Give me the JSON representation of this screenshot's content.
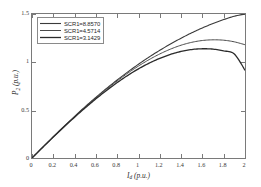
{
  "chart_data": {
    "type": "line",
    "title": "",
    "xlabel": "I_d (p.u.)",
    "ylabel": "P_2 (p.u.)",
    "xlabel_main": "I",
    "xlabel_sub": "d",
    "xlabel_unit": " (p.u.)",
    "ylabel_main": "P",
    "ylabel_sub": "2",
    "ylabel_unit": " (p.u.)",
    "xlim": [
      0,
      2
    ],
    "ylim": [
      0,
      1.5
    ],
    "xticks": [
      "0",
      "0.2",
      "0.4",
      "0.6",
      "0.8",
      "1",
      "1.2",
      "1.4",
      "1.6",
      "1.8",
      "2"
    ],
    "xtick_values": [
      0,
      0.2,
      0.4,
      0.6,
      0.8,
      1,
      1.2,
      1.4,
      1.6,
      1.8,
      2
    ],
    "yticks": [
      "0",
      "0.5",
      "1",
      "1.5"
    ],
    "ytick_values": [
      0,
      0.5,
      1,
      1.5
    ],
    "grid": false,
    "legend_position": "top-left",
    "x": [
      0,
      0.1,
      0.2,
      0.3,
      0.4,
      0.5,
      0.6,
      0.7,
      0.8,
      0.9,
      1.0,
      1.1,
      1.2,
      1.3,
      1.4,
      1.5,
      1.6,
      1.7,
      1.8,
      1.9,
      2.0
    ],
    "series": [
      {
        "name": "SCR1=8.8570",
        "label": "SCR1=8.8570",
        "color": "#3a3a3a",
        "style": "solid",
        "values": [
          0,
          0.112,
          0.222,
          0.33,
          0.434,
          0.535,
          0.632,
          0.725,
          0.813,
          0.897,
          0.977,
          1.052,
          1.122,
          1.187,
          1.248,
          1.304,
          1.355,
          1.401,
          1.442,
          1.477,
          1.5
        ]
      },
      {
        "name": "SCR1=4.5714",
        "label": "SCR1=4.5714",
        "color": "#4a4a4a",
        "style": "solid",
        "values": [
          0,
          0.111,
          0.22,
          0.327,
          0.43,
          0.53,
          0.626,
          0.717,
          0.803,
          0.884,
          0.958,
          1.025,
          1.084,
          1.134,
          1.175,
          1.205,
          1.224,
          1.231,
          1.227,
          1.21,
          1.18
        ]
      },
      {
        "name": "SCR1=3.1429",
        "label": "SCR1=3.1429",
        "color": "#2b2b2b",
        "style": "solid",
        "values": [
          0,
          0.11,
          0.218,
          0.323,
          0.425,
          0.523,
          0.616,
          0.704,
          0.786,
          0.861,
          0.929,
          0.988,
          1.038,
          1.079,
          1.11,
          1.13,
          1.138,
          1.134,
          1.116,
          1.083,
          0.915
        ]
      }
    ]
  },
  "axes": {
    "frame_color": "#7a7a7a"
  }
}
